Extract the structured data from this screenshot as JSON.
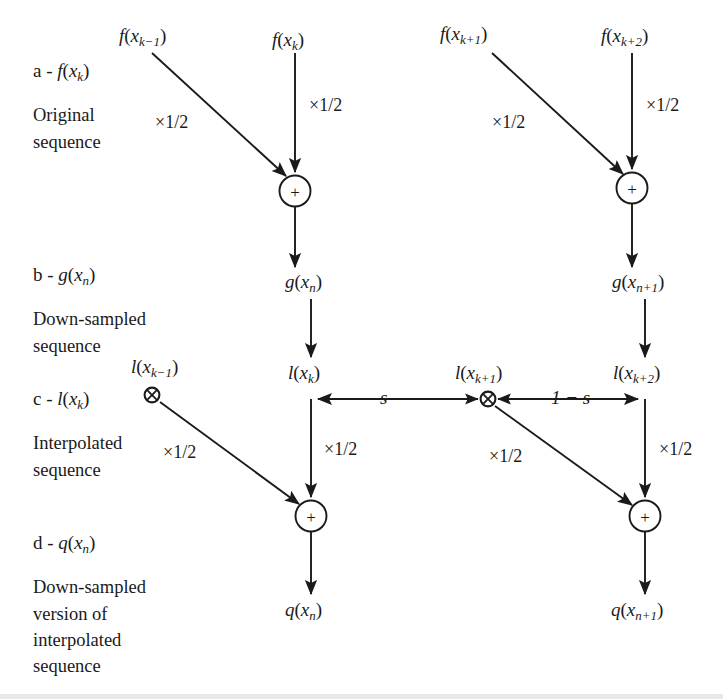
{
  "figure": {
    "type": "signal-flow-diagram",
    "title": "",
    "background_color": "#ffffff",
    "line_color": "#1a1a1a",
    "text_color": "#1a1a1a"
  },
  "row_labels": [
    {
      "id": "a",
      "heading": "a - f(xₖ)",
      "heading_parts": {
        "prefix": "a - ",
        "fn": "f",
        "arg": "x",
        "sub": "k"
      },
      "description_lines": [
        "Original",
        "sequence"
      ]
    },
    {
      "id": "b",
      "heading": "b - g(xₙ)",
      "heading_parts": {
        "prefix": "b - ",
        "fn": "g",
        "arg": "x",
        "sub": "n"
      },
      "description_lines": [
        "Down-sampled",
        "sequence"
      ]
    },
    {
      "id": "c",
      "heading": "c - l(xₖ)",
      "heading_parts": {
        "prefix": "c - ",
        "fn": "l",
        "arg": "x",
        "sub": "k"
      },
      "description_lines": [
        "Interpolated",
        "sequence"
      ]
    },
    {
      "id": "d",
      "heading": "d - q(xₙ)",
      "heading_parts": {
        "prefix": "d - ",
        "fn": "q",
        "arg": "x",
        "sub": "n"
      },
      "description_lines": [
        "Down-sampled",
        "version of",
        "interpolated",
        "sequence"
      ]
    }
  ],
  "nodes": {
    "input_row": [
      {
        "name": "f-x-k-minus-1",
        "fn": "f",
        "arg": "x",
        "sub": "k−1"
      },
      {
        "name": "f-x-k",
        "fn": "f",
        "arg": "x",
        "sub": "k"
      },
      {
        "name": "f-x-k-plus-1",
        "fn": "f",
        "arg": "x",
        "sub": "k+1"
      },
      {
        "name": "f-x-k-plus-2",
        "fn": "f",
        "arg": "x",
        "sub": "k+2"
      }
    ],
    "downsampled_row": [
      {
        "name": "g-x-n",
        "fn": "g",
        "arg": "x",
        "sub": "n"
      },
      {
        "name": "g-x-n-plus-1",
        "fn": "g",
        "arg": "x",
        "sub": "n+1"
      }
    ],
    "interpolated_row": [
      {
        "name": "l-x-k-minus-1",
        "fn": "l",
        "arg": "x",
        "sub": "k−1"
      },
      {
        "name": "l-x-k",
        "fn": "l",
        "arg": "x",
        "sub": "k"
      },
      {
        "name": "l-x-k-plus-1",
        "fn": "l",
        "arg": "x",
        "sub": "k+1"
      },
      {
        "name": "l-x-k-plus-2",
        "fn": "l",
        "arg": "x",
        "sub": "k+2"
      }
    ],
    "output_row": [
      {
        "name": "q-x-n",
        "fn": "q",
        "arg": "x",
        "sub": "n"
      },
      {
        "name": "q-x-n-plus-1",
        "fn": "q",
        "arg": "x",
        "sub": "n+1"
      }
    ]
  },
  "operators": {
    "sum_symbol": "+",
    "multiply_symbol": "⊗",
    "sum_nodes": [
      "top-left-sum",
      "top-right-sum",
      "bottom-left-sum",
      "bottom-right-sum"
    ],
    "multiply_nodes": [
      "mult-left",
      "mult-center"
    ]
  },
  "weights": {
    "half": "×1/2",
    "s": "s",
    "one_minus_s": "1 − s",
    "half_labels_count": 8
  }
}
